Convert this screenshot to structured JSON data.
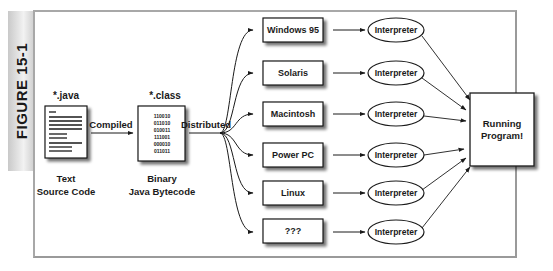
{
  "figure": {
    "label": "FIGURE 15-1"
  },
  "source": {
    "extension": "*.java",
    "caption_line1": "Text",
    "caption_line2": "Source Code"
  },
  "compile_arrow": {
    "label": "Compiled"
  },
  "bytecode": {
    "extension": "*.class",
    "bits": [
      "110010",
      "011010",
      "010011",
      "111001",
      "000010",
      "011011"
    ],
    "caption_line1": "Binary",
    "caption_line2": "Java Bytecode"
  },
  "distribute": {
    "label": "Distributed"
  },
  "platforms": [
    {
      "name": "Windows 95",
      "runtime": "Interpreter"
    },
    {
      "name": "Solaris",
      "runtime": "Interpreter"
    },
    {
      "name": "Macintosh",
      "runtime": "Interpreter"
    },
    {
      "name": "Power PC",
      "runtime": "Interpreter"
    },
    {
      "name": "Linux",
      "runtime": "Interpreter"
    },
    {
      "name": "???",
      "runtime": "Interpreter"
    }
  ],
  "result": {
    "line1": "Running",
    "line2": "Program!"
  },
  "colors": {
    "stroke": "#1a1a1a",
    "frame": "#a8a8a8",
    "shadow": "#9a9a9a"
  }
}
